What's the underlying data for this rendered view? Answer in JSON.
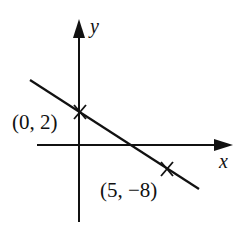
{
  "diagram": {
    "axes": {
      "x_label": "x",
      "y_label": "y"
    },
    "points": [
      {
        "label": "(0, 2)",
        "x": 0,
        "y": 2
      },
      {
        "label": "(5, −8)",
        "x": 5,
        "y": -8
      }
    ],
    "line_color": "#111111",
    "background": "#ffffff"
  }
}
